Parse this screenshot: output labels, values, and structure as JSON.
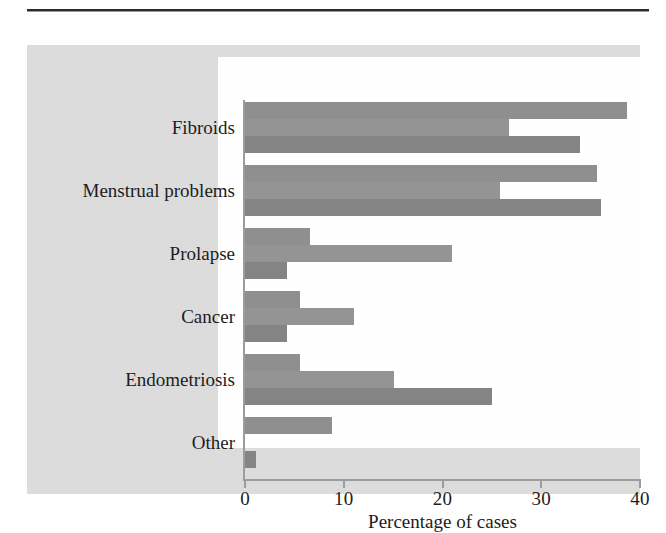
{
  "chart_data": {
    "type": "bar",
    "orientation": "horizontal",
    "title": "",
    "subtitle": "",
    "xlabel": "Percentage of cases",
    "ylabel": "",
    "xlim": [
      0,
      40
    ],
    "xticks": [
      0,
      10,
      20,
      30,
      40
    ],
    "xtick_labels": [
      "0",
      "10",
      "20",
      "30",
      "40"
    ],
    "grid": false,
    "legend": false,
    "legend_position": "none",
    "categories": [
      "Fibroids",
      "Menstrual problems",
      "Prolapse",
      "Cancer",
      "Endometriosis",
      "Other"
    ],
    "series": [
      {
        "name": "series-1",
        "color": "#8f8f8f",
        "values": [
          38.7,
          35.6,
          6.6,
          5.6,
          5.6,
          8.8
        ]
      },
      {
        "name": "series-2",
        "color": "#949494",
        "values": [
          26.7,
          25.8,
          21.0,
          11.0,
          15.1,
          0.0
        ]
      },
      {
        "name": "series-3",
        "color": "#848484",
        "values": [
          33.9,
          36.0,
          4.3,
          4.3,
          25.0,
          1.1
        ]
      }
    ],
    "colors": {
      "bar_gray": "#8d8d8d",
      "panel_background": "#dcdcdc",
      "plot_background": "#ffffff",
      "axis": "#9c9c9c",
      "text": "#1c1c1c",
      "rule": "#2b2b2b"
    }
  }
}
